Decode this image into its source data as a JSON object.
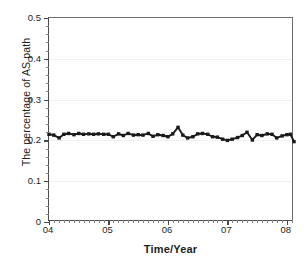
{
  "chart_data": {
    "type": "line",
    "title": "",
    "xlabel": "Time/Year",
    "ylabel": "The percentage of AS path",
    "xlim": [
      2004.0,
      2008.12
    ],
    "ylim": [
      0,
      0.5
    ],
    "grid": true,
    "legend": null,
    "marker": "square",
    "line_color": "#1a1a1a",
    "x_tick_labels": [
      "04",
      "05",
      "06",
      "07",
      "08"
    ],
    "x_tick_values": [
      2004,
      2005,
      2006,
      2007,
      2008
    ],
    "x_minor_ticks_per_major": 12,
    "y_tick_labels": [
      "0",
      "0.1",
      "0.2",
      "0.3",
      "0.4",
      "0.5"
    ],
    "y_tick_values": [
      0,
      0.1,
      0.2,
      0.3,
      0.4,
      0.5
    ],
    "y_minor_ticks_per_major": 5,
    "series": [
      {
        "name": "percentage of AS path",
        "x": [
          2004.0,
          2004.08,
          2004.17,
          2004.25,
          2004.33,
          2004.42,
          2004.5,
          2004.58,
          2004.67,
          2004.75,
          2004.83,
          2004.92,
          2005.0,
          2005.08,
          2005.17,
          2005.25,
          2005.33,
          2005.42,
          2005.5,
          2005.58,
          2005.67,
          2005.75,
          2005.83,
          2005.92,
          2006.0,
          2006.08,
          2006.17,
          2006.25,
          2006.33,
          2006.42,
          2006.5,
          2006.58,
          2006.67,
          2006.75,
          2006.83,
          2006.92,
          2007.0,
          2007.08,
          2007.17,
          2007.25,
          2007.33,
          2007.42,
          2007.5,
          2007.58,
          2007.67,
          2007.75,
          2007.83,
          2007.92,
          2008.0,
          2008.06,
          2008.12
        ],
        "values": [
          0.215,
          0.213,
          0.206,
          0.215,
          0.217,
          0.214,
          0.217,
          0.215,
          0.216,
          0.215,
          0.216,
          0.215,
          0.215,
          0.209,
          0.216,
          0.212,
          0.217,
          0.213,
          0.214,
          0.213,
          0.217,
          0.21,
          0.214,
          0.212,
          0.209,
          0.216,
          0.232,
          0.213,
          0.206,
          0.209,
          0.216,
          0.217,
          0.215,
          0.209,
          0.208,
          0.203,
          0.2,
          0.203,
          0.207,
          0.212,
          0.22,
          0.201,
          0.214,
          0.212,
          0.216,
          0.215,
          0.206,
          0.211,
          0.214,
          0.215,
          0.197
        ]
      }
    ]
  }
}
